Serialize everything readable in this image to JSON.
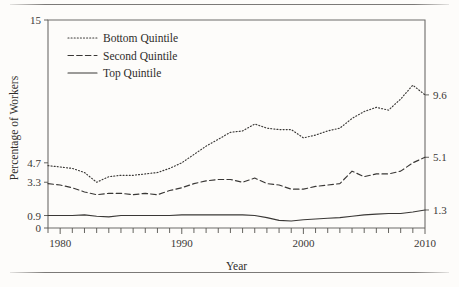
{
  "figure": {
    "background_color": "#fdfcfa",
    "ink_color": "#3a3836",
    "has_top_rule": true,
    "has_bottom_rule": true
  },
  "chart_data": {
    "type": "line",
    "title": "",
    "xlabel": "Year",
    "ylabel": "Percentage of Workers",
    "xlim": [
      1979,
      2010
    ],
    "ylim": [
      0,
      15
    ],
    "grid": false,
    "legend_position": "top-left",
    "x": [
      1979,
      1980,
      1981,
      1982,
      1983,
      1984,
      1985,
      1986,
      1987,
      1988,
      1989,
      1990,
      1991,
      1992,
      1993,
      1994,
      1995,
      1996,
      1997,
      1998,
      1999,
      2000,
      2001,
      2002,
      2003,
      2004,
      2005,
      2006,
      2007,
      2008,
      2009,
      2010
    ],
    "series": [
      {
        "name": "Bottom Quintile",
        "style": "dotted",
        "values": [
          4.5,
          4.4,
          4.3,
          4.0,
          3.3,
          3.7,
          3.8,
          3.8,
          3.9,
          4.0,
          4.3,
          4.7,
          5.3,
          5.9,
          6.4,
          6.9,
          7.0,
          7.5,
          7.2,
          7.1,
          7.1,
          6.5,
          6.7,
          7.0,
          7.2,
          7.9,
          8.4,
          8.7,
          8.5,
          9.3,
          10.3,
          9.6
        ],
        "endpoint_label": "9.6"
      },
      {
        "name": "Second Quintile",
        "style": "dashed",
        "values": [
          3.2,
          3.1,
          2.9,
          2.6,
          2.4,
          2.5,
          2.5,
          2.4,
          2.5,
          2.4,
          2.7,
          2.9,
          3.2,
          3.4,
          3.5,
          3.5,
          3.3,
          3.6,
          3.2,
          3.1,
          2.8,
          2.8,
          3.0,
          3.1,
          3.2,
          4.1,
          3.7,
          3.9,
          3.9,
          4.1,
          4.7,
          5.1
        ],
        "endpoint_label": "5.1"
      },
      {
        "name": "Top Quintile",
        "style": "solid",
        "values": [
          0.9,
          0.9,
          0.9,
          0.95,
          0.85,
          0.8,
          0.9,
          0.9,
          0.9,
          0.9,
          0.9,
          0.95,
          0.95,
          0.95,
          0.95,
          0.95,
          0.95,
          0.9,
          0.75,
          0.55,
          0.5,
          0.6,
          0.65,
          0.7,
          0.75,
          0.85,
          0.95,
          1.0,
          1.05,
          1.05,
          1.15,
          1.3
        ],
        "endpoint_label": "1.3"
      }
    ],
    "left_axis_ticks": [
      {
        "value": 15,
        "label": "15"
      },
      {
        "value": 4.7,
        "label": "4.7"
      },
      {
        "value": 3.3,
        "label": "3.3"
      },
      {
        "value": 0.9,
        "label": "0.9"
      },
      {
        "value": 0,
        "label": "0"
      }
    ],
    "right_axis_ticks": [
      {
        "value": 9.6,
        "label": "9.6"
      },
      {
        "value": 5.1,
        "label": "5.1"
      },
      {
        "value": 1.3,
        "label": "1.3"
      }
    ],
    "x_axis_ticks": [
      {
        "value": 1980,
        "label": "1980"
      },
      {
        "value": 1990,
        "label": "1990"
      },
      {
        "value": 2000,
        "label": "2000"
      },
      {
        "value": 2010,
        "label": "2010"
      }
    ],
    "legend": [
      {
        "label": "Bottom Quintile",
        "style": "dotted"
      },
      {
        "label": "Second Quintile",
        "style": "dashed"
      },
      {
        "label": "Top Quintile",
        "style": "solid"
      }
    ]
  }
}
